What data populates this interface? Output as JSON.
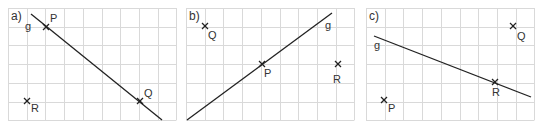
{
  "figure": {
    "colors": {
      "grid": "#d9d9d9",
      "ink": "#222222",
      "label": "#333333"
    },
    "grid": {
      "cols": 9,
      "rows": 6,
      "cell_px": 18.7
    },
    "panels": [
      {
        "id": "a",
        "label": "a)",
        "origin": [
          8,
          8
        ],
        "line": {
          "name": "g",
          "from": [
            31,
            14
          ],
          "to": [
            162,
            120
          ],
          "label_pos": [
            25,
            30
          ]
        },
        "points": [
          {
            "name": "P",
            "at": [
              46,
              27
            ],
            "label_pos": [
              50,
              22
            ]
          },
          {
            "name": "Q",
            "at": [
              140,
              101
            ],
            "label_pos": [
              144,
              97
            ]
          },
          {
            "name": "R",
            "at": [
              27,
              101
            ],
            "label_pos": [
              31,
              112
            ]
          }
        ]
      },
      {
        "id": "b",
        "label": "b)",
        "origin": [
          186,
          8
        ],
        "line": {
          "name": "g",
          "from": [
            187,
            120
          ],
          "to": [
            332,
            13
          ],
          "label_pos": [
            325,
            29
          ]
        },
        "points": [
          {
            "name": "Q",
            "at": [
              205,
              26
            ],
            "label_pos": [
              208,
              39
            ]
          },
          {
            "name": "P",
            "at": [
              262,
              64
            ],
            "label_pos": [
              264,
              77
            ]
          },
          {
            "name": "R",
            "at": [
              338,
              64
            ],
            "label_pos": [
              333,
              83
            ]
          }
        ]
      },
      {
        "id": "c",
        "label": "c)",
        "origin": [
          366,
          8
        ],
        "line": {
          "name": "g",
          "from": [
            374,
            36
          ],
          "to": [
            531,
            97
          ],
          "label_pos": [
            374,
            49
          ]
        },
        "points": [
          {
            "name": "Q",
            "at": [
              513,
              26
            ],
            "label_pos": [
              517,
              40
            ]
          },
          {
            "name": "R",
            "at": [
              495,
              82
            ],
            "label_pos": [
              492,
              96
            ]
          },
          {
            "name": "P",
            "at": [
              384,
              100
            ],
            "label_pos": [
              388,
              112
            ]
          }
        ]
      }
    ]
  }
}
